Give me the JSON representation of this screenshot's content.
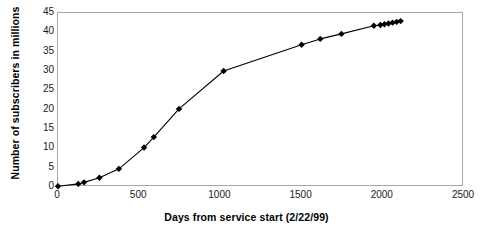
{
  "chart_data": {
    "type": "line",
    "title": "",
    "xlabel": "Days from service start (2/22/99)",
    "ylabel": "Number of subscribers in millions",
    "xlim": [
      0,
      2500
    ],
    "ylim": [
      0,
      45
    ],
    "xticks": [
      0,
      500,
      1000,
      1500,
      2000,
      2500
    ],
    "yticks": [
      0,
      5,
      10,
      15,
      20,
      25,
      30,
      35,
      40,
      45
    ],
    "grid": false,
    "legend": false,
    "marker": "diamond",
    "marker_color": "#000000",
    "line_color": "#000000",
    "series": [
      {
        "name": "Subscribers",
        "points": [
          [
            0,
            0.2
          ],
          [
            125,
            0.8
          ],
          [
            160,
            1.2
          ],
          [
            255,
            2.4
          ],
          [
            375,
            4.7
          ],
          [
            530,
            10.2
          ],
          [
            590,
            12.9
          ],
          [
            745,
            20.2
          ],
          [
            1020,
            30.0
          ],
          [
            1500,
            36.8
          ],
          [
            1615,
            38.3
          ],
          [
            1745,
            39.6
          ],
          [
            1945,
            41.7
          ],
          [
            1985,
            41.9
          ],
          [
            2010,
            42.1
          ],
          [
            2035,
            42.3
          ],
          [
            2060,
            42.5
          ],
          [
            2085,
            42.7
          ],
          [
            2110,
            42.9
          ]
        ]
      }
    ]
  },
  "axes": {
    "x_tick_labels": [
      "0",
      "500",
      "1000",
      "1500",
      "2000",
      "2500"
    ],
    "y_tick_labels": [
      "0",
      "5",
      "10",
      "15",
      "20",
      "25",
      "30",
      "35",
      "40",
      "45"
    ]
  }
}
